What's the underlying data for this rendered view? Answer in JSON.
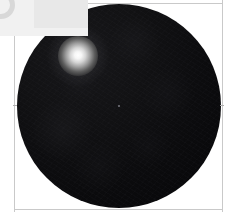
{
  "view": {
    "title": "Dark Sphere Observation",
    "background_color": "#ffffff",
    "width": 230,
    "height": 212
  },
  "frame": {
    "line_color": "#c9c9c9",
    "tick_color": "#b0b0b0",
    "left_axis_x": 14,
    "right_axis_x": 222,
    "top_axis_y": 3,
    "bottom_axis_y": 209,
    "tick_left_y": 105,
    "tick_right_y": 105
  },
  "corner_overlay": {
    "label": "",
    "panel_color": "#f1f1f1",
    "glyph_color": "#d8d8d8",
    "block_color": "#e8e8e8",
    "glyph_name": "partial-ring-glyph"
  },
  "sphere": {
    "label": "",
    "center_x": 119,
    "center_y": 106,
    "radius": 102,
    "fill_color": "#0c0c0e",
    "highlight_color": "#17171a",
    "limb_color": "#050506"
  },
  "bright_spot": {
    "label": "",
    "center_x": 78,
    "center_y": 56,
    "radius": 20,
    "halo_radius": 31,
    "core_color": "#ffffff",
    "glow_color": "#9c9c9c"
  },
  "center_marker": {
    "x": 119,
    "y": 106,
    "color": "#787880"
  }
}
